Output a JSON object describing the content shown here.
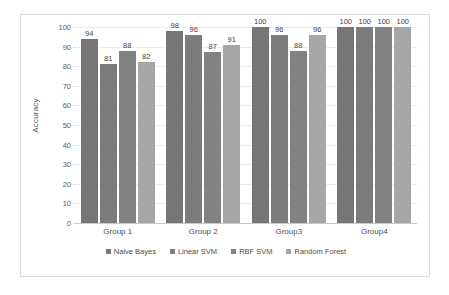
{
  "chart_data": {
    "type": "bar",
    "title": "",
    "xlabel": "",
    "ylabel": "Accuracy",
    "ylim": [
      0,
      100
    ],
    "ytick_step": 10,
    "yticks": [
      100,
      90,
      80,
      70,
      60,
      50,
      40,
      30,
      20,
      10,
      0
    ],
    "grid": true,
    "legend_position": "bottom-center",
    "categories": [
      "Group 1",
      "Group 2",
      "Group3",
      "Group4"
    ],
    "series": [
      {
        "name": "Naive Bayes",
        "color": "#767676",
        "values": [
          94,
          98,
          100,
          100
        ]
      },
      {
        "name": "Linear SVM",
        "color": "#7c7c7c",
        "values": [
          81,
          96,
          96,
          100
        ]
      },
      {
        "name": "RBF SVM",
        "color": "#828282",
        "values": [
          88,
          87,
          88,
          100
        ]
      },
      {
        "name": "Random Forest",
        "color": "#a6a6a6",
        "values": [
          82,
          91,
          96,
          100
        ]
      }
    ]
  },
  "frame": {
    "border_color": "#dcdcdc"
  }
}
